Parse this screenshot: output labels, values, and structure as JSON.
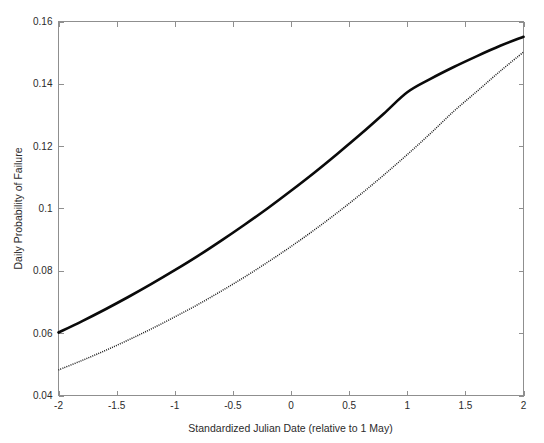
{
  "figure": {
    "background_color": "#ffffff",
    "axis_color": "#8f8f8f",
    "text_color": "#2b2b2b"
  },
  "chart_data": {
    "type": "line",
    "title": "",
    "subtitle": "",
    "xlabel": "Standardized Julian Date (relative to 1 May)",
    "ylabel": "Daily Probability of Failure",
    "xlim": [
      -2,
      2
    ],
    "ylim": [
      0.04,
      0.16
    ],
    "xticks": [
      -2,
      -1.5,
      -1,
      -0.5,
      0,
      0.5,
      1,
      1.5,
      2
    ],
    "xticklabels": [
      "-2",
      "-1.5",
      "-1",
      "-0.5",
      "0",
      "0.5",
      "1",
      "1.5",
      "2"
    ],
    "yticks": [
      0.04,
      0.06,
      0.08,
      0.1,
      0.12,
      0.14,
      0.16
    ],
    "yticklabels": [
      "0.04",
      "0.06",
      "0.08",
      "0.1",
      "0.12",
      "0.14",
      "0.16"
    ],
    "grid": false,
    "legend": null,
    "box": true,
    "ticks_direction": "in",
    "x": [
      -2,
      -1.8,
      -1.6,
      -1.4,
      -1.2,
      -1,
      -0.8,
      -0.6,
      -0.4,
      -0.2,
      0,
      0.2,
      0.4,
      0.6,
      0.8,
      1,
      1.2,
      1.4,
      1.6,
      1.8,
      2
    ],
    "series": [
      {
        "name": "upper-curve",
        "style": "solid",
        "color": "#0a0a0a",
        "linewidth": 2.6,
        "values": [
          0.0602,
          0.0638,
          0.0676,
          0.0716,
          0.0758,
          0.0802,
          0.0848,
          0.0897,
          0.0948,
          0.1001,
          0.1057,
          0.1115,
          0.1176,
          0.1239,
          0.1305,
          0.1373,
          0.1416,
          0.1454,
          0.1489,
          0.1522,
          0.1551
        ]
      },
      {
        "name": "lower-curve",
        "style": "dotted",
        "color": "#1a1a1a",
        "linewidth": 1.5,
        "values": [
          0.0482,
          0.0512,
          0.0544,
          0.0578,
          0.0614,
          0.0652,
          0.0692,
          0.0735,
          0.078,
          0.0828,
          0.0878,
          0.0931,
          0.0987,
          0.1046,
          0.1108,
          0.1173,
          0.1241,
          0.1312,
          0.1376,
          0.1441,
          0.1502
        ]
      }
    ]
  }
}
